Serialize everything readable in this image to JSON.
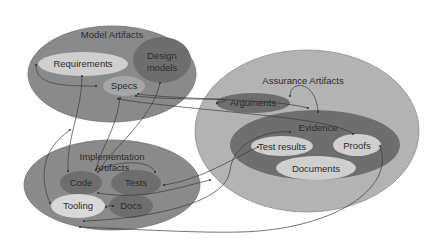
{
  "diagram": {
    "groups": {
      "model": {
        "title": "Model Artifacts",
        "items": {
          "requirements": "Requirements",
          "design_models_1": "Design",
          "design_models_2": "models",
          "specs": "Specs"
        }
      },
      "assurance": {
        "title": "Assurance Artifacts",
        "items": {
          "arguments": "Arguments"
        },
        "evidence": {
          "title": "Evidence",
          "items": {
            "test_results": "Test results",
            "proofs": "Proofs",
            "documents": "Documents"
          }
        }
      },
      "implementation": {
        "title_1": "Implementation",
        "title_2": "Artifacts",
        "items": {
          "code": "Code",
          "tests": "Tests",
          "tooling": "Tooling",
          "docs": "Docs"
        }
      }
    },
    "colors": {
      "outer_dark": "#8a8a8a",
      "outer_assurance": "#b3b3b3",
      "inner_dark": "#6e6e6e",
      "inner_light": "#cfcfcf",
      "edge": "#3a3a3a"
    }
  }
}
